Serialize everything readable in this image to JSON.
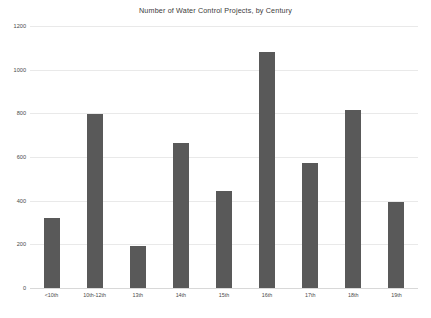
{
  "chart_data": {
    "type": "bar",
    "title": "Number of Water Control Projects, by Century",
    "xlabel": "",
    "ylabel": "",
    "categories": [
      "<10th",
      "10th-12th",
      "13th",
      "14th",
      "15th",
      "16th",
      "17th",
      "18th",
      "19th"
    ],
    "values": [
      321,
      795,
      192,
      664,
      444,
      1081,
      573,
      816,
      394
    ],
    "ylim": [
      0,
      1200
    ],
    "yticks": [
      0,
      200,
      400,
      600,
      800,
      1000,
      1200
    ],
    "ytick_labels": [
      "0",
      "200",
      "400",
      "600",
      "800",
      "1000",
      "1200"
    ],
    "grid": true,
    "legend": false,
    "bar_color": "#595959",
    "grid_color": "#e9e9e9",
    "background_color": "#ffffff",
    "text_color": "#4a4a4a"
  }
}
